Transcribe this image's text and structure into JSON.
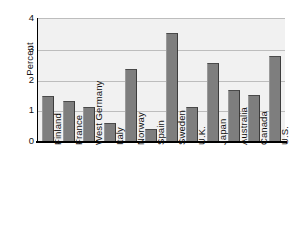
{
  "chart_data": {
    "type": "bar",
    "title": "",
    "xlabel": "",
    "ylabel": "Percent",
    "ylim": [
      0,
      4
    ],
    "yticks": [
      0,
      1,
      2,
      3,
      4
    ],
    "grid": true,
    "legend": "none",
    "categories": [
      "Finland",
      "France",
      "West Germany",
      "Italy",
      "Norway",
      "Spain",
      "Sweden",
      "U.K.",
      "Japan",
      "Australia",
      "Canada",
      "U.S."
    ],
    "values": [
      1.45,
      1.3,
      1.1,
      0.6,
      2.35,
      0.4,
      3.5,
      1.1,
      2.55,
      1.65,
      1.5,
      2.75
    ],
    "colors": {
      "bar_fill": "#7e7e7e",
      "bar_edge": "#3c3c3c",
      "plot_background": "#f1f1f1",
      "gridline": "#bdbdbd",
      "axis": "#000000",
      "text": "#111111",
      "page_background": "#ffffff"
    }
  }
}
